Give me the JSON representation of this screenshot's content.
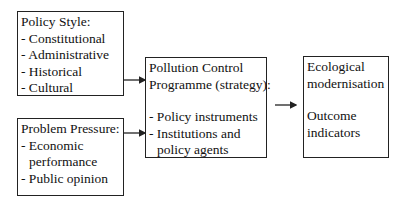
{
  "diagram": {
    "policy_style": {
      "title": "Policy Style:",
      "items": [
        "- Constitutional",
        "- Administrative",
        "- Historical",
        "- Cultural"
      ]
    },
    "problem_pressure": {
      "title": "Problem Pressure:",
      "items": [
        "- Economic",
        "performance",
        "- Public opinion"
      ]
    },
    "programme": {
      "title_line1": "Pollution Control",
      "title_line2": "Programme (strategy):",
      "items": [
        "- Policy instruments",
        "- Institutions and",
        "policy agents"
      ]
    },
    "outcome": {
      "line1": "Ecological",
      "line2": "modernisation",
      "line3": "Outcome",
      "line4": "indicators"
    },
    "colors": {
      "stroke": "#222222",
      "background": "#ffffff"
    }
  }
}
